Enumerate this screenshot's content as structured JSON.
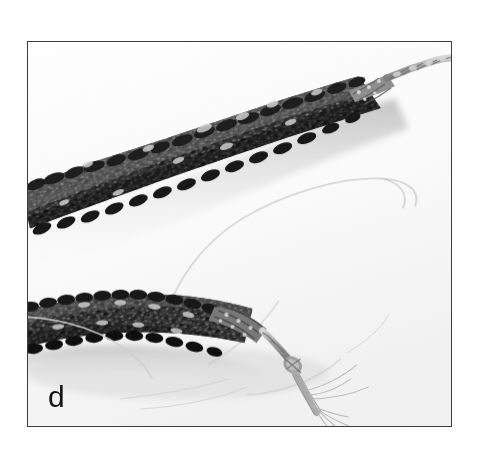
{
  "figure": {
    "panel_label": "d",
    "caption_text": "",
    "border_color": "#3c3c3c",
    "background_color": "#ffffff"
  },
  "photo": {
    "description": "Grayscale photograph of two strands of dark irregular chip beads with braided cord ends and frayed fibre tassels on a plain white background",
    "palette": {
      "paper_white": "#ffffff",
      "soft_shadow": "#dcdcdc",
      "mid_shadow": "#c9c9c9",
      "cord_gray": "#a6a6a6",
      "cord_dark": "#8a8a8a",
      "thread_gray": "#bdbdbd",
      "bead_dark": "#1c1c1c",
      "bead_mid": "#4a4a4a",
      "bead_light": "#9e9e9e",
      "bead_highlight": "#e8e8e8"
    },
    "objects": [
      {
        "name": "upper-bead-strand",
        "label": "Upper strand of dark chip beads running from lower-left to upper-right"
      },
      {
        "name": "upper-cord-end",
        "label": "Braided cord extending from the upper strand toward the top-right"
      },
      {
        "name": "lower-bead-strand",
        "label": "Lower strand of dark chip beads entering from the left edge"
      },
      {
        "name": "lower-cord-knot",
        "label": "Knotted braided cord at the end of the lower strand"
      },
      {
        "name": "frayed-fibres",
        "label": "Splayed frayed fibre ends below the knot"
      },
      {
        "name": "loose-thread-loop",
        "label": "Thin pale thread looping across the centre of the frame"
      },
      {
        "name": "cast-shadow",
        "label": "Soft gray shadow cast beneath the strands"
      }
    ]
  }
}
